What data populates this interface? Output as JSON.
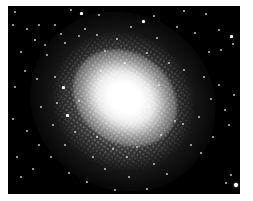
{
  "image": {
    "subject": "globular star cluster",
    "style": "black-and-white astronomical photograph",
    "colors": {
      "page_background": "#ffffff",
      "sky": "#000000",
      "stars": "#ffffff"
    },
    "frame": {
      "x": 8,
      "y": 6,
      "width": 232,
      "height": 188
    },
    "core_center": {
      "x": 125,
      "y": 105
    },
    "core_orientation_deg": 35
  },
  "stars": [
    {
      "x": 6,
      "y": 5,
      "s": 2
    },
    {
      "x": 30,
      "y": 18,
      "s": 2
    },
    {
      "x": 62,
      "y": 3,
      "s": 2
    },
    {
      "x": 72,
      "y": 6,
      "s": 3
    },
    {
      "x": 90,
      "y": 8,
      "s": 2
    },
    {
      "x": 4,
      "y": 18,
      "s": 2
    },
    {
      "x": 18,
      "y": 22,
      "s": 2
    },
    {
      "x": 46,
      "y": 18,
      "s": 1
    },
    {
      "x": 76,
      "y": 22,
      "s": 2
    },
    {
      "x": 26,
      "y": 33,
      "s": 2
    },
    {
      "x": 36,
      "y": 38,
      "s": 2
    },
    {
      "x": 12,
      "y": 45,
      "s": 2
    },
    {
      "x": 56,
      "y": 36,
      "s": 2
    },
    {
      "x": 70,
      "y": 29,
      "s": 1
    },
    {
      "x": 52,
      "y": 27,
      "s": 2
    },
    {
      "x": 38,
      "y": 48,
      "s": 1
    },
    {
      "x": 6,
      "y": 80,
      "s": 2
    },
    {
      "x": 16,
      "y": 64,
      "s": 1
    },
    {
      "x": 28,
      "y": 72,
      "s": 1
    },
    {
      "x": 54,
      "y": 80,
      "s": 3
    },
    {
      "x": 46,
      "y": 70,
      "s": 1
    },
    {
      "x": 134,
      "y": 14,
      "s": 3
    },
    {
      "x": 145,
      "y": 9,
      "s": 2
    },
    {
      "x": 175,
      "y": 4,
      "s": 2
    },
    {
      "x": 197,
      "y": 7,
      "s": 1
    },
    {
      "x": 122,
      "y": 20,
      "s": 2
    },
    {
      "x": 148,
      "y": 31,
      "s": 2
    },
    {
      "x": 168,
      "y": 20,
      "s": 2
    },
    {
      "x": 186,
      "y": 26,
      "s": 2
    },
    {
      "x": 210,
      "y": 23,
      "s": 2
    },
    {
      "x": 222,
      "y": 29,
      "s": 3
    },
    {
      "x": 224,
      "y": 37,
      "s": 2
    },
    {
      "x": 200,
      "y": 45,
      "s": 2
    },
    {
      "x": 212,
      "y": 43,
      "s": 2
    },
    {
      "x": 138,
      "y": 46,
      "s": 1
    },
    {
      "x": 160,
      "y": 56,
      "s": 1
    },
    {
      "x": 175,
      "y": 63,
      "s": 2
    },
    {
      "x": 195,
      "y": 70,
      "s": 1
    },
    {
      "x": 210,
      "y": 78,
      "s": 2
    },
    {
      "x": 225,
      "y": 88,
      "s": 2
    },
    {
      "x": 202,
      "y": 92,
      "s": 1
    },
    {
      "x": 216,
      "y": 103,
      "s": 2
    },
    {
      "x": 190,
      "y": 110,
      "s": 1
    },
    {
      "x": 174,
      "y": 117,
      "s": 2
    },
    {
      "x": 166,
      "y": 114,
      "s": 2
    },
    {
      "x": 182,
      "y": 138,
      "s": 1
    },
    {
      "x": 204,
      "y": 130,
      "s": 1
    },
    {
      "x": 220,
      "y": 118,
      "s": 2
    },
    {
      "x": 192,
      "y": 146,
      "s": 1
    },
    {
      "x": 222,
      "y": 168,
      "s": 2
    },
    {
      "x": 226,
      "y": 177,
      "s": 4
    },
    {
      "x": 217,
      "y": 176,
      "s": 2
    },
    {
      "x": 158,
      "y": 167,
      "s": 2
    },
    {
      "x": 138,
      "y": 182,
      "s": 1
    },
    {
      "x": 145,
      "y": 157,
      "s": 2
    },
    {
      "x": 120,
      "y": 170,
      "s": 1
    },
    {
      "x": 106,
      "y": 183,
      "s": 2
    },
    {
      "x": 96,
      "y": 162,
      "s": 2
    },
    {
      "x": 78,
      "y": 175,
      "s": 1
    },
    {
      "x": 60,
      "y": 166,
      "s": 2
    },
    {
      "x": 42,
      "y": 150,
      "s": 1
    },
    {
      "x": 24,
      "y": 162,
      "s": 2
    },
    {
      "x": 12,
      "y": 170,
      "s": 1
    },
    {
      "x": 8,
      "y": 150,
      "s": 2
    },
    {
      "x": 30,
      "y": 138,
      "s": 2
    },
    {
      "x": 44,
      "y": 118,
      "s": 2
    },
    {
      "x": 56,
      "y": 138,
      "s": 1
    },
    {
      "x": 66,
      "y": 125,
      "s": 2
    },
    {
      "x": 18,
      "y": 124,
      "s": 1
    },
    {
      "x": 32,
      "y": 100,
      "s": 2
    },
    {
      "x": 4,
      "y": 112,
      "s": 1
    },
    {
      "x": 48,
      "y": 96,
      "s": 1
    },
    {
      "x": 58,
      "y": 108,
      "s": 3
    },
    {
      "x": 70,
      "y": 94,
      "s": 2
    },
    {
      "x": 84,
      "y": 150,
      "s": 2
    },
    {
      "x": 88,
      "y": 130,
      "s": 2
    },
    {
      "x": 104,
      "y": 142,
      "s": 2
    },
    {
      "x": 128,
      "y": 140,
      "s": 2
    },
    {
      "x": 96,
      "y": 44,
      "s": 2
    },
    {
      "x": 108,
      "y": 32,
      "s": 2
    },
    {
      "x": 88,
      "y": 28,
      "s": 1
    },
    {
      "x": 116,
      "y": 56,
      "s": 2
    },
    {
      "x": 92,
      "y": 64,
      "s": 2
    },
    {
      "x": 150,
      "y": 78,
      "s": 2
    },
    {
      "x": 140,
      "y": 100,
      "s": 2
    },
    {
      "x": 152,
      "y": 128,
      "s": 1
    },
    {
      "x": 118,
      "y": 150,
      "s": 1
    }
  ]
}
